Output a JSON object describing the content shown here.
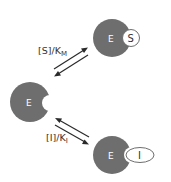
{
  "diagram": {
    "enzyme_color": "#6e6e6e",
    "arrow_color": "#2a2a2a",
    "free_enzyme": {
      "label": "E"
    },
    "substrate_complex": {
      "enzyme_label": "E",
      "ligand_label": "S"
    },
    "inhibitor_complex": {
      "enzyme_label": "E",
      "ligand_label": "I"
    },
    "substrate_equilibrium": {
      "label_main": "[S]/K",
      "label_sub": "M"
    },
    "inhibitor_equilibrium": {
      "label_main": "[I]/K",
      "label_sub": "I"
    }
  }
}
